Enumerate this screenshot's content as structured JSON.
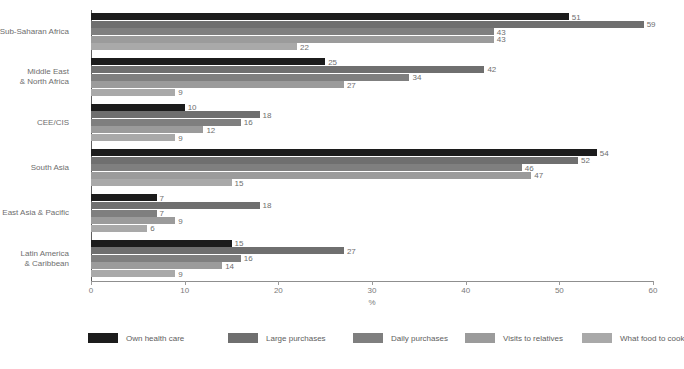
{
  "chart_data": {
    "type": "bar",
    "orientation": "horizontal",
    "title": "",
    "xlabel": "%",
    "ylabel": "",
    "xlim": [
      0,
      60
    ],
    "xticks": [
      0,
      10,
      20,
      30,
      40,
      50,
      60
    ],
    "grid": false,
    "legend_position": "bottom",
    "categories": [
      "Sub-Saharan Africa",
      "Middle East\n& North Africa",
      "CEE/CIS",
      "South Asia",
      "East Asia & Pacific",
      "Latin America\n& Caribbean"
    ],
    "series": [
      {
        "name": "Own health care",
        "color": "#1c1c1c",
        "values": [
          51,
          25,
          10,
          54,
          7,
          15
        ]
      },
      {
        "name": "Large purchases",
        "color": "#6f6f6f",
        "values": [
          59,
          42,
          18,
          52,
          18,
          27
        ]
      },
      {
        "name": "Daily purchases",
        "color": "#7f7f7f",
        "values": [
          43,
          34,
          16,
          46,
          7,
          16
        ]
      },
      {
        "name": "Visits to relatives",
        "color": "#9b9b9b",
        "values": [
          43,
          27,
          12,
          47,
          9,
          14
        ]
      },
      {
        "name": "What food to cook",
        "color": "#a9a9a9",
        "values": [
          22,
          9,
          9,
          15,
          6,
          9
        ]
      }
    ]
  },
  "axis": {
    "x_tick_labels": [
      "0",
      "10",
      "20",
      "30",
      "40",
      "50",
      "60"
    ],
    "x_axis_title": "%"
  },
  "legend": {
    "items": [
      {
        "label": "Own health care",
        "color": "#1c1c1c"
      },
      {
        "label": "Large purchases",
        "color": "#6f6f6f"
      },
      {
        "label": "Daily purchases",
        "color": "#7f7f7f"
      },
      {
        "label": "Visits to relatives",
        "color": "#9b9b9b"
      },
      {
        "label": "What food to cook",
        "color": "#a9a9a9"
      }
    ]
  }
}
